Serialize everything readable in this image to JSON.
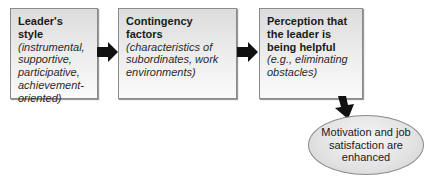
{
  "diagram": {
    "boxes": [
      {
        "title": "Leader's style",
        "desc": "(instrumental, supportive, participative, achievement-oriented)"
      },
      {
        "title": "Contingency factors",
        "desc": "(characteristics of subordinates, work environments)"
      },
      {
        "title": "Perception that the leader is being helpful",
        "desc": "(e.g., eliminating obstacles)"
      }
    ],
    "outcome": {
      "text": "Motivation and job satisfaction are enhanced"
    },
    "colors": {
      "box_fill": "#e6e6e6",
      "box_border": "#8a8a8a",
      "arrow": "#111111"
    }
  }
}
